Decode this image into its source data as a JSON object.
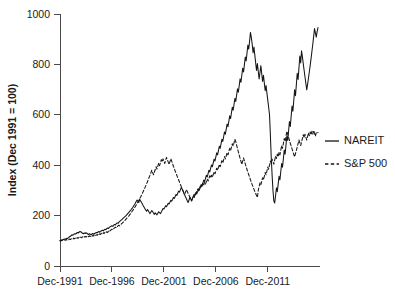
{
  "chart_data": {
    "type": "line",
    "title": "",
    "subtitle": "",
    "xlabel": "",
    "ylabel": "Index (Dec 1991 = 100)",
    "xlim": [
      "Dec-1991",
      "Dec-2012"
    ],
    "ylim": [
      0,
      1000
    ],
    "yticks": [
      0,
      200,
      400,
      600,
      800,
      1000
    ],
    "ytick_labels": [
      "0",
      "200",
      "400",
      "600",
      "800",
      "1000"
    ],
    "xticks": [
      "Dec-1991",
      "Dec-1996",
      "Dec-2001",
      "Dec-2006",
      "Dec-2011"
    ],
    "xtick_labels": [
      "Dec-1991",
      "Dec-1996",
      "Dec-2001",
      "Dec-2006",
      "Dec-2011"
    ],
    "grid": false,
    "legend_position": "right",
    "line_color": "#151515",
    "axis_color": "#4a4a4a",
    "x_start_year": 1991.9583,
    "x_step_years": 0.0833333,
    "series": [
      {
        "name": "NAREIT",
        "style": "solid",
        "values": [
          100,
          101,
          104,
          103,
          105,
          107,
          106,
          108,
          110,
          109,
          113,
          116,
          118,
          121,
          124,
          122,
          126,
          128,
          127,
          130,
          133,
          131,
          134,
          137,
          136,
          133,
          130,
          128,
          131,
          129,
          132,
          130,
          127,
          125,
          128,
          126,
          124,
          127,
          129,
          126,
          129,
          131,
          133,
          132,
          135,
          137,
          134,
          138,
          140,
          142,
          139,
          143,
          146,
          144,
          148,
          151,
          149,
          153,
          156,
          158,
          160,
          157,
          162,
          165,
          163,
          168,
          171,
          169,
          174,
          177,
          180,
          183,
          186,
          190,
          193,
          196,
          199,
          203,
          207,
          211,
          215,
          219,
          223,
          228,
          232,
          238,
          243,
          249,
          256,
          262,
          258,
          252,
          265,
          259,
          253,
          247,
          240,
          234,
          228,
          222,
          217,
          224,
          219,
          213,
          208,
          214,
          220,
          216,
          210,
          205,
          211,
          207,
          203,
          209,
          215,
          212,
          208,
          214,
          221,
          228,
          226,
          232,
          239,
          235,
          242,
          249,
          246,
          253,
          261,
          257,
          264,
          272,
          268,
          276,
          284,
          280,
          289,
          297,
          293,
          302,
          311,
          306,
          297,
          288,
          282,
          274,
          267,
          259,
          252,
          262,
          272,
          266,
          258,
          268,
          278,
          272,
          282,
          292,
          286,
          296,
          307,
          301,
          312,
          323,
          317,
          329,
          341,
          335,
          347,
          360,
          353,
          366,
          380,
          373,
          387,
          401,
          394,
          409,
          424,
          417,
          433,
          449,
          441,
          458,
          475,
          467,
          485,
          503,
          494,
          513,
          532,
          523,
          543,
          563,
          553,
          574,
          596,
          585,
          607,
          630,
          618,
          641,
          665,
          653,
          678,
          703,
          690,
          716,
          743,
          729,
          757,
          785,
          770,
          799,
          829,
          814,
          845,
          877,
          861,
          893,
          927,
          906,
          880,
          846,
          869,
          838,
          806,
          776,
          803,
          772,
          742,
          768,
          795,
          763,
          732,
          757,
          726,
          696,
          716,
          686,
          658,
          630,
          600,
          520,
          430,
          360,
          300,
          258,
          250,
          280,
          310,
          295,
          325,
          356,
          342,
          374,
          407,
          392,
          426,
          460,
          444,
          479,
          515,
          498,
          535,
          573,
          554,
          594,
          635,
          614,
          656,
          699,
          676,
          720,
          765,
          740,
          786,
          833,
          806,
          854,
          830,
          802,
          776,
          750,
          724,
          699,
          722,
          746,
          771,
          797,
          824,
          852,
          881,
          911,
          942,
          925,
          908,
          930,
          946
        ]
      },
      {
        "name": "S&P 500",
        "style": "dashed",
        "values": [
          100,
          102,
          100,
          103,
          101,
          104,
          102,
          105,
          103,
          106,
          104,
          107,
          105,
          108,
          110,
          107,
          111,
          108,
          112,
          109,
          113,
          110,
          114,
          111,
          115,
          112,
          116,
          113,
          117,
          114,
          118,
          115,
          119,
          116,
          120,
          117,
          121,
          118,
          122,
          119,
          123,
          120,
          124,
          122,
          126,
          123,
          128,
          125,
          130,
          127,
          132,
          129,
          134,
          131,
          136,
          133,
          138,
          135,
          141,
          143,
          146,
          143,
          148,
          151,
          154,
          151,
          156,
          159,
          162,
          159,
          164,
          167,
          170,
          174,
          177,
          181,
          185,
          189,
          193,
          197,
          201,
          206,
          210,
          215,
          220,
          225,
          230,
          236,
          242,
          248,
          254,
          260,
          267,
          273,
          280,
          287,
          295,
          302,
          310,
          318,
          326,
          334,
          343,
          352,
          361,
          370,
          380,
          371,
          362,
          372,
          383,
          394,
          385,
          396,
          408,
          398,
          410,
          422,
          413,
          425,
          416,
          407,
          419,
          431,
          422,
          412,
          403,
          414,
          426,
          416,
          406,
          396,
          387,
          377,
          368,
          359,
          350,
          341,
          333,
          324,
          316,
          308,
          300,
          292,
          285,
          294,
          303,
          296,
          288,
          281,
          274,
          267,
          260,
          268,
          276,
          285,
          278,
          287,
          296,
          305,
          298,
          307,
          317,
          310,
          320,
          330,
          322,
          332,
          325,
          335,
          345,
          337,
          347,
          358,
          350,
          360,
          352,
          363,
          374,
          366,
          377,
          388,
          380,
          391,
          403,
          394,
          406,
          418,
          409,
          421,
          434,
          425,
          437,
          450,
          441,
          454,
          467,
          458,
          471,
          485,
          476,
          489,
          503,
          494,
          480,
          466,
          453,
          440,
          427,
          415,
          403,
          416,
          429,
          417,
          405,
          394,
          383,
          372,
          362,
          352,
          342,
          332,
          323,
          314,
          305,
          296,
          288,
          280,
          272,
          300,
          315,
          330,
          322,
          336,
          350,
          342,
          356,
          371,
          362,
          377,
          393,
          384,
          400,
          417,
          407,
          424,
          414,
          404,
          420,
          437,
          427,
          444,
          433,
          451,
          441,
          459,
          478,
          467,
          486,
          506,
          494,
          514,
          535,
          523,
          511,
          499,
          487,
          476,
          465,
          454,
          443,
          433,
          446,
          459,
          472,
          486,
          500,
          489,
          478,
          492,
          506,
          521,
          509,
          523,
          511,
          500,
          514,
          529,
          517,
          532,
          520,
          535,
          523,
          538,
          526,
          515,
          530,
          527,
          530
        ]
      }
    ]
  },
  "legend": {
    "entries": [
      {
        "label": "NAREIT",
        "style": "solid"
      },
      {
        "label": "S&P 500",
        "style": "dashed"
      }
    ]
  }
}
